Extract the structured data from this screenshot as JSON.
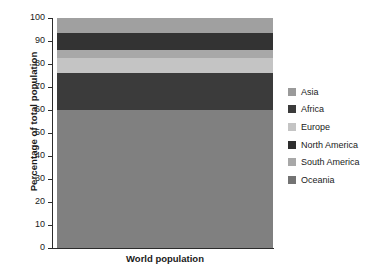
{
  "chart_data": {
    "type": "bar",
    "title": "",
    "subtitle": "",
    "xlabel": "",
    "ylabel": "Percentage of total population",
    "categories": [
      "World population"
    ],
    "ylim": [
      0,
      100
    ],
    "yticks": [
      0,
      10,
      20,
      30,
      40,
      50,
      60,
      70,
      80,
      90,
      100
    ],
    "ytick_labels": [
      "0",
      "10",
      "20",
      "30",
      "40",
      "50",
      "60",
      "70",
      "80",
      "90",
      "100"
    ],
    "grid": false,
    "stacked": true,
    "legend_position": "right",
    "series": [
      {
        "name": "Asia",
        "values": [
          60.0
        ],
        "cumulative_top": 60.0,
        "color": "#808080"
      },
      {
        "name": "Africa",
        "values": [
          16.0
        ],
        "cumulative_top": 76.0,
        "color": "#3b3b3b"
      },
      {
        "name": "Europe",
        "values": [
          6.5
        ],
        "cumulative_top": 82.5,
        "color": "#c4c4c4"
      },
      {
        "name": "North America",
        "values": [
          3.5
        ],
        "cumulative_top": 86.0,
        "color": "#a8a8a8"
      },
      {
        "name": "South America",
        "values": [
          7.5
        ],
        "cumulative_top": 93.5,
        "color": "#333333"
      },
      {
        "name": "Oceania",
        "values": [
          6.5
        ],
        "cumulative_top": 100.0,
        "color": "#a0a0a0"
      }
    ]
  },
  "axes": {
    "y_title": "Percentage of total population",
    "ticks": [
      {
        "value": 100,
        "label": "100"
      },
      {
        "value": 90,
        "label": "90"
      },
      {
        "value": 80,
        "label": "80"
      },
      {
        "value": 70,
        "label": "70"
      },
      {
        "value": 60,
        "label": "60"
      },
      {
        "value": 50,
        "label": "50"
      },
      {
        "value": 40,
        "label": "40"
      },
      {
        "value": 30,
        "label": "30"
      },
      {
        "value": 20,
        "label": "20"
      },
      {
        "value": 10,
        "label": "10"
      },
      {
        "value": 0,
        "label": "0"
      }
    ],
    "category_label": "World population"
  },
  "legend": {
    "items": [
      {
        "label": "Asia",
        "color": "#9a9a9a"
      },
      {
        "label": "Africa",
        "color": "#3b3b3b"
      },
      {
        "label": "Europe",
        "color": "#c4c4c4"
      },
      {
        "label": "North America",
        "color": "#2e2e2e"
      },
      {
        "label": "South America",
        "color": "#a8a8a8"
      },
      {
        "label": "Oceania",
        "color": "#737373"
      }
    ]
  }
}
